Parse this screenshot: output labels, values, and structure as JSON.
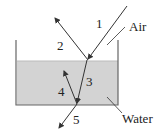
{
  "diagram": {
    "labels": {
      "ray1": "1",
      "ray2": "2",
      "ray3": "3",
      "ray4": "4",
      "ray5": "5",
      "air": "Air",
      "water": "Water"
    },
    "colors": {
      "water_fill": "#d3d3d3",
      "line": "#333333",
      "wall": "#666666"
    }
  }
}
